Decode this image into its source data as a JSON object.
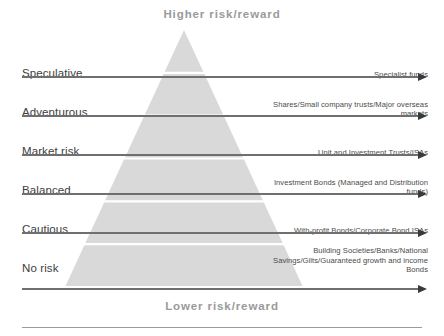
{
  "diagram": {
    "title_top": "Higher risk/reward",
    "title_bottom": "Lower risk/reward",
    "colors": {
      "pyramid_fill": "#d9d9d9",
      "arrow": "#6f6f6f",
      "arrow_head": "#3a3a3a",
      "caption_text": "#9a9a9a",
      "tier_name_text": "#3d3d3d",
      "products_text": "#4a4a4a",
      "background": "#ffffff"
    },
    "tiers": [
      {
        "name": "Speculative",
        "products": "Specialist funds"
      },
      {
        "name": "Adventurous",
        "products": "Shares/Small company trusts/Major overseas markets"
      },
      {
        "name": "Market risk",
        "products": "Unit and Investment Trusts/ISAs"
      },
      {
        "name": "Balanced",
        "products": "Investment Bonds (Managed and Distribution funds)"
      },
      {
        "name": "Cautious",
        "products": "With-profit Bonds/Corporate Bond ISAs"
      },
      {
        "name": "No risk",
        "products": "Building Societies/Banks/National Savings/Gilts/Guaranteed growth and income Bonds"
      }
    ]
  }
}
